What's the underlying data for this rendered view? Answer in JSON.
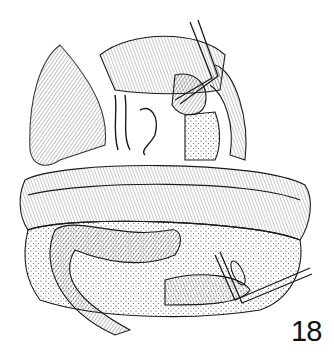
{
  "figure": {
    "label": "18",
    "type": "surgical line illustration",
    "colors": {
      "ink": "#1a1a1a",
      "background": "#ffffff"
    }
  }
}
